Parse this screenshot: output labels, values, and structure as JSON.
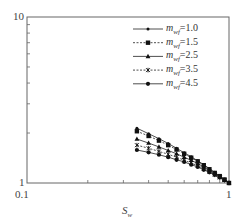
{
  "chart_data": {
    "type": "line",
    "title": "",
    "xlabel": "S_w",
    "ylabel": "",
    "xscale": "log",
    "yscale": "log",
    "xlim": [
      0.1,
      1
    ],
    "ylim": [
      1,
      10
    ],
    "x_tick_labels": [
      "0.1",
      "1"
    ],
    "y_tick_labels": [
      "1",
      "10"
    ],
    "legend_position": "upper right",
    "x": [
      0.35,
      0.4,
      0.45,
      0.5,
      0.55,
      0.6,
      0.65,
      0.7,
      0.75,
      0.8,
      0.85,
      0.9,
      0.95,
      1.0
    ],
    "series": [
      {
        "name": "m_wf=1.0",
        "marker": "small-dot",
        "linestyle": "solid",
        "values": [
          2.14,
          1.98,
          1.85,
          1.73,
          1.62,
          1.52,
          1.44,
          1.36,
          1.29,
          1.22,
          1.16,
          1.1,
          1.05,
          1.0
        ]
      },
      {
        "name": "m_wf=1.5",
        "marker": "square",
        "linestyle": "dashed",
        "values": [
          2.05,
          1.92,
          1.8,
          1.69,
          1.59,
          1.5,
          1.42,
          1.35,
          1.28,
          1.21,
          1.15,
          1.1,
          1.05,
          1.0
        ]
      },
      {
        "name": "m_wf=2.5",
        "marker": "triangle",
        "linestyle": "solid",
        "values": [
          1.84,
          1.74,
          1.65,
          1.57,
          1.5,
          1.43,
          1.37,
          1.31,
          1.25,
          1.19,
          1.14,
          1.09,
          1.04,
          1.0
        ]
      },
      {
        "name": "m_wf=3.5",
        "marker": "x-star",
        "linestyle": "dashed",
        "values": [
          1.69,
          1.62,
          1.55,
          1.49,
          1.43,
          1.37,
          1.32,
          1.27,
          1.22,
          1.17,
          1.12,
          1.08,
          1.04,
          1.0
        ]
      },
      {
        "name": "m_wf=4.5",
        "marker": "circle",
        "linestyle": "solid",
        "values": [
          1.58,
          1.53,
          1.48,
          1.43,
          1.38,
          1.34,
          1.29,
          1.25,
          1.2,
          1.16,
          1.12,
          1.08,
          1.04,
          1.0
        ]
      }
    ]
  },
  "axes": {
    "x_label_main": "S",
    "x_label_sub": "w",
    "x_ticks": {
      "min": "0.1",
      "max": "1"
    },
    "y_ticks": {
      "min": "1",
      "max": "10"
    }
  },
  "legend": [
    {
      "prefix": "m",
      "sub": "wf",
      "value": "=1.0"
    },
    {
      "prefix": "m",
      "sub": "wf",
      "value": "=1.5"
    },
    {
      "prefix": "m",
      "sub": "wf",
      "value": "=2.5"
    },
    {
      "prefix": "m",
      "sub": "wf",
      "value": "=3.5"
    },
    {
      "prefix": "m",
      "sub": "wf",
      "value": "=4.5"
    }
  ]
}
